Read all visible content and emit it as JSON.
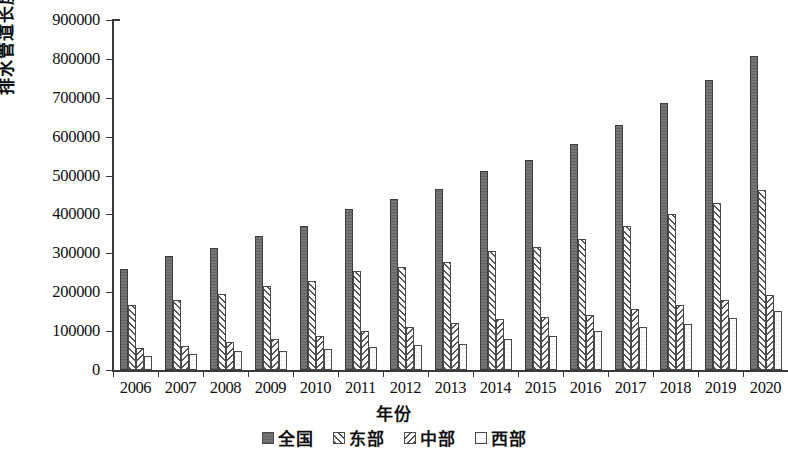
{
  "chart_data": {
    "type": "bar",
    "title": "",
    "xlabel": "年份",
    "ylabel": "排水管道长度（km）",
    "ylim": [
      0,
      900000
    ],
    "ytick_labels": [
      "900000",
      "800000",
      "700000",
      "600000",
      "500000",
      "400000",
      "300000",
      "200000",
      "100000",
      "0"
    ],
    "ytick_values": [
      900000,
      800000,
      700000,
      600000,
      500000,
      400000,
      300000,
      200000,
      100000,
      0
    ],
    "grid": false,
    "legend_position": "bottom",
    "categories": [
      "2006",
      "2007",
      "2008",
      "2009",
      "2010",
      "2011",
      "2012",
      "2013",
      "2014",
      "2015",
      "2016",
      "2017",
      "2018",
      "2019",
      "2020"
    ],
    "series": [
      {
        "name": "全国",
        "pattern": "solid-dark-gray",
        "values": [
          260000,
          292000,
          315000,
          344000,
          370000,
          414000,
          440000,
          465000,
          511000,
          540000,
          580000,
          630000,
          687000,
          745000,
          808000
        ]
      },
      {
        "name": "东部",
        "pattern": "diagonal-hatch-forward",
        "values": [
          168000,
          181000,
          195000,
          215000,
          228000,
          255000,
          265000,
          277000,
          305000,
          317000,
          338000,
          371000,
          401000,
          430000,
          463000
        ]
      },
      {
        "name": "中部",
        "pattern": "diagonal-hatch-backward",
        "values": [
          57000,
          63000,
          72000,
          80000,
          88000,
          101000,
          110000,
          121000,
          130000,
          136000,
          141000,
          156000,
          168000,
          181000,
          192000
        ]
      },
      {
        "name": "西部",
        "pattern": "empty-white",
        "values": [
          35000,
          42000,
          48000,
          50000,
          54000,
          58000,
          64000,
          67000,
          80000,
          88000,
          101000,
          110000,
          118000,
          134000,
          152000
        ]
      }
    ]
  },
  "legend": {
    "items": [
      {
        "label": "全国",
        "pattern": "solid-dark-gray"
      },
      {
        "label": "东部",
        "pattern": "diagonal-hatch-forward"
      },
      {
        "label": "中部",
        "pattern": "diagonal-hatch-backward"
      },
      {
        "label": "西部",
        "pattern": "empty-white"
      }
    ]
  },
  "colors": {
    "series_quanguo": "#6e6e6e",
    "axis": "#3a3a3a",
    "background": "#ffffff",
    "text": "#0f0f0f"
  }
}
